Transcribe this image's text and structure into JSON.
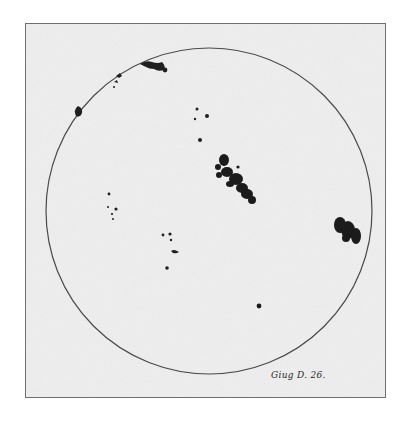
{
  "image": {
    "subject": "Hand-drawn sunspot observation on solar disc",
    "caption": "Giug D. 26.",
    "colors": {
      "background": "#ffffff",
      "paper": "#eeeeee",
      "frame_border": "#6f6f6f",
      "disc_outline": "#4a4a4a",
      "spots": "#1a1a1a"
    },
    "disc": {
      "cx": 183,
      "cy": 187,
      "r": 163
    },
    "sunspot_groups": [
      {
        "name": "top-limb-group",
        "position": "upper-left near limb"
      },
      {
        "name": "upper-left-limb-mark",
        "position": "left limb"
      },
      {
        "name": "upper-center-cluster",
        "position": "upper center"
      },
      {
        "name": "central-large-group",
        "position": "center right, diagonal band"
      },
      {
        "name": "right-limb-group",
        "position": "right limb"
      },
      {
        "name": "left-middle-cluster",
        "position": "left middle"
      },
      {
        "name": "lower-center-cluster",
        "position": "lower center"
      },
      {
        "name": "lower-right-single-spot",
        "position": "lower right"
      }
    ]
  }
}
